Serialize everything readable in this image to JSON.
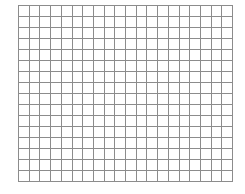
{
  "grid": {
    "columns": 20,
    "rows": 16,
    "line_color": "#8c8c8c",
    "background": "#ffffff",
    "left": 18,
    "top": 5,
    "width": 215,
    "height": 177
  }
}
